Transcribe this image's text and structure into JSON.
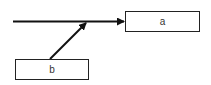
{
  "diagram": {
    "nodes": [
      {
        "id": "a",
        "label": "a"
      },
      {
        "id": "b",
        "label": "b"
      }
    ],
    "edges": [
      {
        "from": "left-input",
        "to": "a",
        "type": "arrow"
      },
      {
        "from": "b",
        "to": "edge-midpoint",
        "type": "arrow"
      }
    ],
    "colors": {
      "stroke": "#111111",
      "box_border": "#222222",
      "background": "#ffffff"
    }
  }
}
